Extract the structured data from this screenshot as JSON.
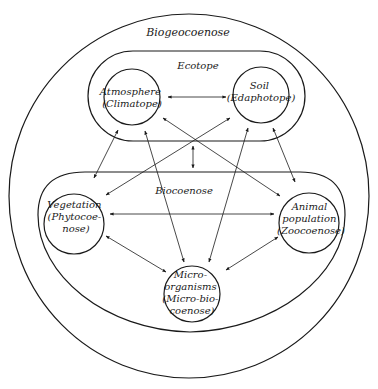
{
  "diagram": {
    "outer": {
      "label": "Biogeocoenose"
    },
    "ecotope": {
      "label": "Ecotope",
      "nodes": [
        {
          "id": "atmosphere",
          "lines": [
            "Atmosphere",
            "(Climatope)"
          ]
        },
        {
          "id": "soil",
          "lines": [
            "Soil",
            "(Edaphotope)"
          ]
        }
      ]
    },
    "biocoenose": {
      "label": "Biocoenose",
      "nodes": [
        {
          "id": "vegetation",
          "lines": [
            "Vegetation",
            "(Phytocoe-",
            "nose)"
          ]
        },
        {
          "id": "animal",
          "lines": [
            "Animal",
            "population",
            "(Zoocoenose)"
          ]
        },
        {
          "id": "micro",
          "lines": [
            "Micro-",
            "organisms",
            "(Micro-bio-",
            "coenose)"
          ]
        }
      ]
    },
    "edges": [
      {
        "from": "atmosphere",
        "to": "soil",
        "type": "bidirectional"
      },
      {
        "from": "atmosphere",
        "to": "vegetation",
        "type": "bidirectional"
      },
      {
        "from": "atmosphere",
        "to": "animal",
        "type": "bidirectional"
      },
      {
        "from": "atmosphere",
        "to": "micro",
        "type": "bidirectional"
      },
      {
        "from": "soil",
        "to": "vegetation",
        "type": "bidirectional"
      },
      {
        "from": "soil",
        "to": "animal",
        "type": "bidirectional"
      },
      {
        "from": "soil",
        "to": "micro",
        "type": "bidirectional"
      },
      {
        "from": "vegetation",
        "to": "animal",
        "type": "bidirectional"
      },
      {
        "from": "vegetation",
        "to": "micro",
        "type": "bidirectional"
      },
      {
        "from": "animal",
        "to": "micro",
        "type": "bidirectional"
      },
      {
        "from": "ecotope",
        "to": "biocoenose",
        "type": "bidirectional"
      }
    ]
  }
}
